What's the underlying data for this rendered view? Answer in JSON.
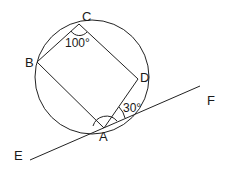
{
  "diagram": {
    "type": "geometry",
    "circle": {
      "cx": 92,
      "cy": 77,
      "r": 57
    },
    "points": {
      "A": {
        "label": "A",
        "x": 104,
        "y": 128
      },
      "B": {
        "label": "B",
        "x": 37,
        "y": 62
      },
      "C": {
        "label": "C",
        "x": 79,
        "y": 24
      },
      "D": {
        "label": "D",
        "x": 138,
        "y": 79
      },
      "E": {
        "label": "E",
        "x": 30,
        "y": 160
      },
      "F": {
        "label": "F",
        "x": 200,
        "y": 86
      }
    },
    "labels": {
      "A": "A",
      "B": "B",
      "C": "C",
      "D": "D",
      "E": "E",
      "F": "F"
    },
    "angles": {
      "BCD": "100°",
      "DAF": "30°"
    },
    "segments": [
      "AB",
      "BC",
      "CD",
      "DA",
      "EF"
    ]
  }
}
